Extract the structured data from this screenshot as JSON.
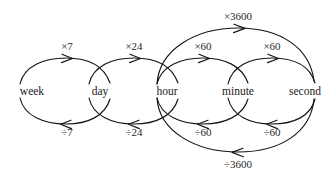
{
  "diagram": {
    "type": "unit-conversion-graph",
    "background_color": "#ffffff",
    "stroke_color": "#141414",
    "text_color": "#1a1a1a",
    "nodes": [
      {
        "id": "week",
        "label": "week",
        "x": 32,
        "y": 91
      },
      {
        "id": "day",
        "label": "day",
        "x": 100,
        "y": 91
      },
      {
        "id": "hour",
        "label": "hour",
        "x": 167,
        "y": 91
      },
      {
        "id": "minute",
        "label": "minute",
        "x": 238,
        "y": 91
      },
      {
        "id": "second",
        "label": "second",
        "x": 305,
        "y": 91
      }
    ],
    "edges": [
      {
        "id": "week-to-day",
        "from": "week",
        "to": "day",
        "label": "×7",
        "direction": "forward",
        "position": "upper",
        "label_x": 67,
        "label_y": 58
      },
      {
        "id": "day-to-week",
        "from": "day",
        "to": "week",
        "label": "÷7",
        "direction": "backward",
        "position": "lower",
        "label_x": 67,
        "label_y": 130
      },
      {
        "id": "day-to-hour",
        "from": "day",
        "to": "hour",
        "label": "×24",
        "direction": "forward",
        "position": "upper",
        "label_x": 134,
        "label_y": 58
      },
      {
        "id": "hour-to-day",
        "from": "hour",
        "to": "day",
        "label": "÷24",
        "direction": "backward",
        "position": "lower",
        "label_x": 134,
        "label_y": 130
      },
      {
        "id": "hour-to-minute",
        "from": "hour",
        "to": "minute",
        "label": "×60",
        "direction": "forward",
        "position": "upper",
        "label_x": 203,
        "label_y": 58
      },
      {
        "id": "minute-to-hour",
        "from": "minute",
        "to": "hour",
        "label": "÷60",
        "direction": "backward",
        "position": "lower",
        "label_x": 203,
        "label_y": 130
      },
      {
        "id": "minute-to-second",
        "from": "minute",
        "to": "second",
        "label": "×60",
        "direction": "forward",
        "position": "upper",
        "label_x": 272,
        "label_y": 58
      },
      {
        "id": "second-to-minute",
        "from": "second",
        "to": "minute",
        "label": "÷60",
        "direction": "backward",
        "position": "lower",
        "label_x": 272,
        "label_y": 130
      },
      {
        "id": "hour-to-second",
        "from": "hour",
        "to": "second",
        "label": "×3600",
        "direction": "forward",
        "position": "outer-upper",
        "label_x": 238,
        "label_y": 18
      },
      {
        "id": "second-to-hour",
        "from": "second",
        "to": "hour",
        "label": "÷3600",
        "direction": "backward",
        "position": "outer-lower",
        "label_x": 238,
        "label_y": 170
      }
    ]
  }
}
